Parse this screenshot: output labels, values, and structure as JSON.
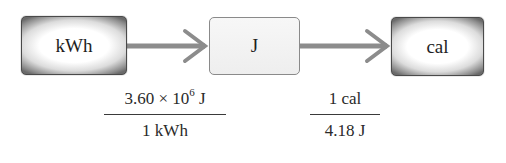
{
  "diagram": {
    "title": "",
    "nodes": [
      {
        "id": "kwh",
        "label": "kWh",
        "style": "dark-gradient"
      },
      {
        "id": "j",
        "label": "J",
        "style": "light"
      },
      {
        "id": "cal",
        "label": "cal",
        "style": "dark-gradient"
      }
    ],
    "edges": [
      {
        "from": "kwh",
        "to": "j"
      },
      {
        "from": "j",
        "to": "cal"
      }
    ],
    "conversion_factors": [
      {
        "numerator": {
          "coefficient": "3.60 × 10",
          "exponent": "6",
          "unit": " J"
        },
        "denominator": "1 kWh"
      },
      {
        "numerator": "1 cal",
        "denominator": "4.18 J"
      }
    ],
    "colors": {
      "arrow": "#8c8c8c",
      "box_border_dark": "#4a4a4a",
      "box_border_light": "#8a8a8a",
      "text": "#1e1e1e"
    }
  }
}
